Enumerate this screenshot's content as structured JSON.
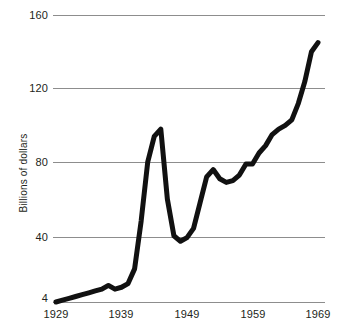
{
  "chart_data": {
    "type": "line",
    "title": "",
    "subtitle": "",
    "xlabel": "",
    "ylabel": "Billions of dollars",
    "xlim": [
      1929,
      1969
    ],
    "ylim": [
      4,
      160
    ],
    "grid": true,
    "legend": null,
    "yticks": [
      4,
      40,
      80,
      120,
      160
    ],
    "ytick_labels": [
      "4",
      "40",
      "80",
      "120",
      "160"
    ],
    "xticks": [
      1929,
      1939,
      1949,
      1959,
      1969
    ],
    "xtick_labels": [
      "1929",
      "1939",
      "1949",
      "1959",
      "1969"
    ],
    "series": [
      {
        "name": "Federal budget outlays",
        "color": "#111111",
        "x": [
          1929,
          1930,
          1931,
          1932,
          1933,
          1934,
          1935,
          1936,
          1937,
          1938,
          1939,
          1940,
          1941,
          1942,
          1943,
          1944,
          1945,
          1946,
          1947,
          1948,
          1949,
          1950,
          1951,
          1952,
          1953,
          1954,
          1955,
          1956,
          1957,
          1958,
          1959,
          1960,
          1961,
          1962,
          1963,
          1964,
          1965,
          1966,
          1967,
          1968,
          1969
        ],
        "values": [
          4,
          5,
          6,
          7,
          8,
          9,
          10,
          11,
          13,
          11,
          12,
          14,
          22,
          48,
          80,
          94,
          98,
          60,
          40,
          37,
          39,
          44,
          58,
          72,
          76,
          71,
          69,
          70,
          73,
          79,
          79,
          85,
          89,
          95,
          98,
          100,
          103,
          112,
          124,
          140,
          145
        ]
      }
    ],
    "annotations": []
  },
  "axes": {
    "y_axis_title": "Billions of dollars"
  }
}
